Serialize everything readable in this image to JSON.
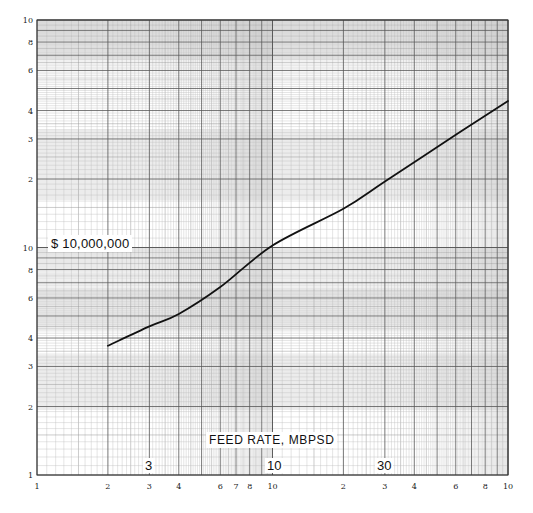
{
  "chart_data": {
    "type": "line",
    "title": "",
    "xlabel": "FEED RATE, MBPSD",
    "ylabel": "$ 10,000,000",
    "xscale": "log",
    "yscale": "log",
    "xlim": [
      1,
      100
    ],
    "ylim": [
      1,
      100
    ],
    "x_tick_labels": [
      "1",
      "2",
      "3",
      "4",
      "6",
      "7",
      "8",
      "10",
      "2",
      "3",
      "4",
      "6",
      "8",
      "10"
    ],
    "x_tick_values": [
      1,
      2,
      3,
      4,
      6,
      7,
      8,
      10,
      20,
      30,
      40,
      60,
      80,
      100
    ],
    "y_tick_labels": [
      "1",
      "2",
      "3",
      "4",
      "6",
      "8",
      "10",
      "2",
      "3",
      "4",
      "6",
      "8",
      "10"
    ],
    "y_tick_values": [
      1,
      2,
      3,
      4,
      6,
      8,
      10,
      20,
      30,
      40,
      60,
      80,
      100
    ],
    "annotations": [
      "$ 10,000,000",
      "FEED RATE, MBPSD",
      "3",
      "10",
      "30"
    ],
    "grid": true,
    "series": [
      {
        "name": "Cost curve",
        "x": [
          2,
          3,
          4,
          6,
          10,
          20,
          30,
          60,
          100
        ],
        "y": [
          3.7,
          4.5,
          5.1,
          6.7,
          10.2,
          14.8,
          19.5,
          31.3,
          44
        ]
      }
    ]
  },
  "labels": {
    "cost_unit": "$ 10,000,000",
    "x_axis_title": "FEED RATE, MBPSD",
    "big_x": [
      "3",
      "10",
      "30"
    ]
  }
}
